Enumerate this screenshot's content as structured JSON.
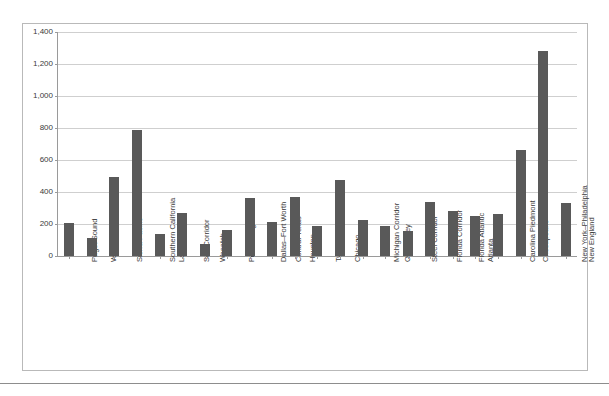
{
  "chart_data": {
    "type": "bar",
    "title": "",
    "subtitle": "",
    "xlabel": "",
    "ylabel": "",
    "ylim": [
      0,
      1400
    ],
    "ytick_values": [
      0,
      200,
      400,
      600,
      800,
      1000,
      1200,
      1400
    ],
    "ytick_labels": [
      "0",
      "200",
      "400",
      "600",
      "800",
      "1,000",
      "1,200",
      "1,400"
    ],
    "grid": true,
    "legend": false,
    "legend_position": "none",
    "bar_color": "#595959",
    "categories": [
      "Puget Sound",
      "Willamette",
      "Sierra Pacific",
      "Southern California",
      "Las Vegas",
      "Sun Corridor",
      "Wasatch",
      "Front Range",
      "Dallas–Fort Worth",
      "Central Texas",
      "Houston",
      "Twin Cities",
      "Chicago",
      "Michigan Corridor",
      "Ohio Valley",
      "Steel Corridor",
      "Florida Corridor",
      "Florida Atlantic",
      "Atlanta",
      "Carolina Piedmont",
      "Chesapeake",
      "New York–Philadelphia",
      "New England"
    ],
    "values": [
      205,
      112,
      495,
      785,
      135,
      270,
      75,
      160,
      365,
      215,
      370,
      185,
      475,
      225,
      190,
      155,
      340,
      280,
      250,
      260,
      660,
      1280,
      330
    ]
  }
}
